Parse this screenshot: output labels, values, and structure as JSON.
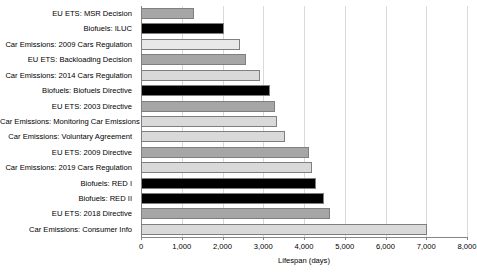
{
  "chart_data": {
    "type": "bar",
    "orientation": "horizontal",
    "title": "",
    "xlabel": "Lifespan (days)",
    "ylabel": "",
    "xlim": [
      0,
      8000
    ],
    "xticks": [
      0,
      1000,
      2000,
      3000,
      4000,
      5000,
      6000,
      7000,
      8000
    ],
    "xtick_labels": [
      "0",
      "1,000",
      "2,000",
      "3,000",
      "4,000",
      "5,000",
      "6,000",
      "7,000",
      "8,000"
    ],
    "grid": "vertical",
    "legend": "none",
    "categories": [
      "EU ETS: MSR Decision",
      "Biofuels: ILUC",
      "Car Emissions: 2009 Cars Regulation",
      "EU ETS: Backloading Decision",
      "Car Emissions: 2014 Cars Regulation",
      "Biofuels: Biofuels Directive",
      "EU ETS: 2003 Directive",
      "Car Emissions: Monitoring Car Emissions",
      "Car Emissions: Voluntary Agreement",
      "EU ETS: 2009 Directive",
      "Car Emissions: 2019 Cars Regulation",
      "Biofuels: RED I",
      "Biofuels: RED II",
      "EU ETS: 2018 Directive",
      "Car Emissions: Consumer Info"
    ],
    "values": [
      1300,
      2030,
      2430,
      2580,
      2920,
      3170,
      3300,
      3340,
      3540,
      4130,
      4200,
      4300,
      4490,
      4640,
      7020
    ],
    "colors": [
      "#a6a6a6",
      "#000000",
      "#e8e8e8",
      "#a6a6a6",
      "#d9d9d9",
      "#000000",
      "#a6a6a6",
      "#d9d9d9",
      "#d9d9d9",
      "#a6a6a6",
      "#d9d9d9",
      "#000000",
      "#000000",
      "#a6a6a6",
      "#d9d9d9"
    ],
    "bar_border_color": "#7f7f7f",
    "gridline_color": "#d9d9d9",
    "axis_color": "#868686",
    "background_color": "#ffffff"
  }
}
